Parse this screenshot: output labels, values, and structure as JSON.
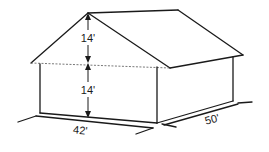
{
  "diagram": {
    "dimensions": {
      "roof_height": "14'",
      "wall_height": "14'",
      "width": "42'",
      "depth": "50'"
    },
    "colors": {
      "line": "#1a1a1a",
      "background": "#ffffff"
    }
  }
}
